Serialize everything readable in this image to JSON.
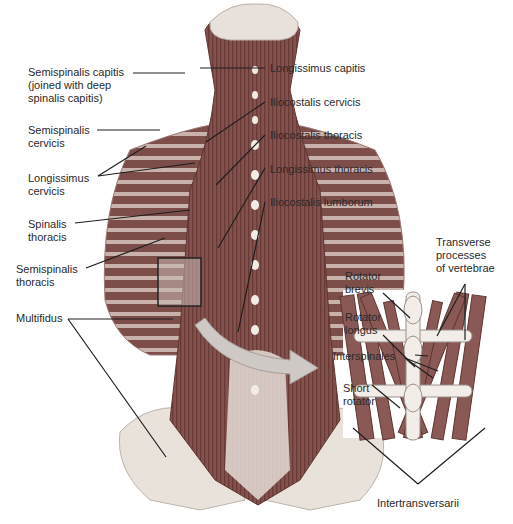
{
  "figure": {
    "type": "anatomical-diagram",
    "colors": {
      "muscle": "#8a5a55",
      "muscle_dark": "#6e3f3c",
      "bone": "#ece4dc",
      "leader_line": "#1e1e1e",
      "arrow": "#c9c3bf"
    }
  },
  "left_labels": [
    {
      "id": "semispinalis-capitis",
      "text": "Semispinalis capitis\n(joined with deep\nspinalis capitis)"
    },
    {
      "id": "semispinalis-cervicis",
      "text": "Semispinalis\ncervicis"
    },
    {
      "id": "longissimus-cervicis",
      "text": "Longissimus\ncervicis"
    },
    {
      "id": "spinalis-thoracis",
      "text": "Spinalis\nthoracis"
    },
    {
      "id": "semispinalis-thoracis",
      "text": "Semispinalis\nthoracis"
    },
    {
      "id": "multifidus",
      "text": "Multifidus"
    }
  ],
  "right_labels": [
    {
      "id": "longissimus-capitis",
      "text": "Longissimus capitis"
    },
    {
      "id": "iliocostalis-cervicis",
      "text": "Iliocostalis cervicis"
    },
    {
      "id": "iliocostalis-thoracis",
      "text": "Iliocostalis thoracis"
    },
    {
      "id": "longissimus-thoracis",
      "text": "Longissimus thoracis"
    },
    {
      "id": "iliocostalis-lumborum",
      "text": "Iliocostalis lumborum"
    }
  ],
  "inset_labels": [
    {
      "id": "rotator-brevis",
      "text": "Rotator\nbrevis"
    },
    {
      "id": "rotator-longus",
      "text": "Rotator\nlongus"
    },
    {
      "id": "interspinales",
      "text": "Interspinales"
    },
    {
      "id": "short-rotator",
      "text": "Short\nrotator"
    },
    {
      "id": "transverse-processes",
      "text": "Transverse\nprocesses\nof vertebrae"
    },
    {
      "id": "intertransversarii",
      "text": "Intertransversarii"
    }
  ]
}
